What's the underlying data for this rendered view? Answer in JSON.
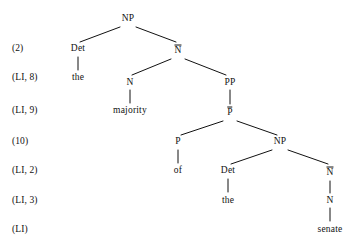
{
  "figure": {
    "kind": "x-bar-syntax-tree",
    "phrase": "the majority of the senate",
    "background_color": "#ffffff",
    "text_color": "#111111",
    "line_color": "#111111"
  },
  "step_labels": [
    {
      "name": "row-2",
      "text": "(2)",
      "x": 12,
      "y": 48
    },
    {
      "name": "row-li-8",
      "text": "(LI, 8)",
      "x": 12,
      "y": 77
    },
    {
      "name": "row-li-9",
      "text": "(LI, 9)",
      "x": 12,
      "y": 110
    },
    {
      "name": "row-10",
      "text": "(10)",
      "x": 12,
      "y": 141
    },
    {
      "name": "row-li-2",
      "text": "(LI, 2)",
      "x": 12,
      "y": 170
    },
    {
      "name": "row-li-3",
      "text": "(LI, 3)",
      "x": 12,
      "y": 200
    },
    {
      "name": "row-li",
      "text": "(LI)",
      "x": 12,
      "y": 229
    }
  ],
  "nodes": [
    {
      "name": "node-np-root",
      "text": "NP",
      "x": 128,
      "y": 18,
      "bar": false,
      "terminal": false
    },
    {
      "name": "node-det-1",
      "text": "Det",
      "x": 78,
      "y": 48,
      "bar": false,
      "terminal": false
    },
    {
      "name": "node-nbar-1",
      "text": "N",
      "x": 178,
      "y": 50,
      "bar": true,
      "terminal": false
    },
    {
      "name": "terminal-the-1",
      "text": "the",
      "x": 78,
      "y": 77,
      "bar": false,
      "terminal": true
    },
    {
      "name": "node-n-1",
      "text": "N",
      "x": 130,
      "y": 82,
      "bar": false,
      "terminal": false
    },
    {
      "name": "node-pp",
      "text": "PP",
      "x": 230,
      "y": 82,
      "bar": false,
      "terminal": false
    },
    {
      "name": "terminal-majority",
      "text": "majority",
      "x": 130,
      "y": 110,
      "bar": false,
      "terminal": true
    },
    {
      "name": "node-pbar",
      "text": "P",
      "x": 230,
      "y": 112,
      "bar": true,
      "terminal": false
    },
    {
      "name": "node-p",
      "text": "P",
      "x": 178,
      "y": 141,
      "bar": false,
      "terminal": false
    },
    {
      "name": "node-np-2",
      "text": "NP",
      "x": 280,
      "y": 141,
      "bar": false,
      "terminal": false
    },
    {
      "name": "terminal-of",
      "text": "of",
      "x": 178,
      "y": 170,
      "bar": false,
      "terminal": true
    },
    {
      "name": "node-det-2",
      "text": "Det",
      "x": 228,
      "y": 170,
      "bar": false,
      "terminal": false
    },
    {
      "name": "node-nbar-2",
      "text": "N",
      "x": 330,
      "y": 172,
      "bar": true,
      "terminal": false
    },
    {
      "name": "terminal-the-2",
      "text": "the",
      "x": 228,
      "y": 200,
      "bar": false,
      "terminal": true
    },
    {
      "name": "node-n-2",
      "text": "N",
      "x": 330,
      "y": 200,
      "bar": false,
      "terminal": false
    },
    {
      "name": "terminal-senate",
      "text": "senate",
      "x": 330,
      "y": 229,
      "bar": false,
      "terminal": true
    }
  ],
  "edges": [
    {
      "name": "edge-np-det",
      "x1": 120,
      "y1": 27,
      "x2": 80,
      "y2": 42
    },
    {
      "name": "edge-np-nbar",
      "x1": 136,
      "y1": 27,
      "x2": 176,
      "y2": 42
    },
    {
      "name": "edge-nbar-n",
      "x1": 171,
      "y1": 59,
      "x2": 132,
      "y2": 75
    },
    {
      "name": "edge-nbar-pp",
      "x1": 185,
      "y1": 59,
      "x2": 226,
      "y2": 75
    },
    {
      "name": "edge-det1-the1",
      "x1": 78,
      "y1": 57,
      "x2": 78,
      "y2": 70
    },
    {
      "name": "edge-n1-majority",
      "x1": 130,
      "y1": 90,
      "x2": 130,
      "y2": 103
    },
    {
      "name": "edge-pp-pbar",
      "x1": 230,
      "y1": 90,
      "x2": 230,
      "y2": 104
    },
    {
      "name": "edge-pbar-p",
      "x1": 223,
      "y1": 121,
      "x2": 181,
      "y2": 135
    },
    {
      "name": "edge-pbar-np2",
      "x1": 237,
      "y1": 121,
      "x2": 277,
      "y2": 135
    },
    {
      "name": "edge-p-of",
      "x1": 178,
      "y1": 150,
      "x2": 178,
      "y2": 163
    },
    {
      "name": "edge-np2-det2",
      "x1": 272,
      "y1": 150,
      "x2": 231,
      "y2": 164
    },
    {
      "name": "edge-np2-nbar2",
      "x1": 288,
      "y1": 150,
      "x2": 328,
      "y2": 164
    },
    {
      "name": "edge-det2-the2",
      "x1": 228,
      "y1": 179,
      "x2": 228,
      "y2": 192
    },
    {
      "name": "edge-nbar2-n2",
      "x1": 330,
      "y1": 181,
      "x2": 330,
      "y2": 193
    },
    {
      "name": "edge-n2-senate",
      "x1": 330,
      "y1": 208,
      "x2": 330,
      "y2": 221
    }
  ]
}
